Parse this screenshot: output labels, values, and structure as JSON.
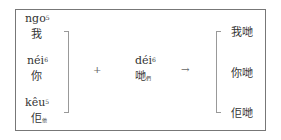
{
  "left_column": [
    {
      "romanization": "ngo",
      "tone": "5",
      "character": "我",
      "subscript": ""
    },
    {
      "romanization": "néi",
      "tone": "6",
      "character": "你",
      "subscript": ""
    },
    {
      "romanization": "kêu",
      "tone": "5",
      "character": "佢",
      "subscript": "他"
    }
  ],
  "operator_plus": "+",
  "middle": {
    "romanization": "déi",
    "tone": "6",
    "character": "哋",
    "subscript": "們"
  },
  "operator_arrow": "→",
  "results": [
    "我哋",
    "你哋",
    "佢哋"
  ]
}
